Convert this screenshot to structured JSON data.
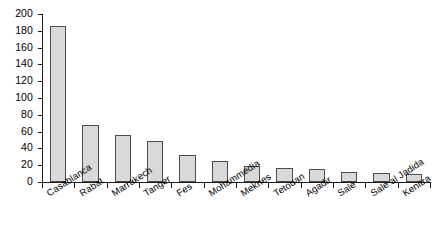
{
  "chart_data": {
    "type": "bar",
    "title": "",
    "xlabel": "",
    "ylabel": "",
    "ylim": [
      0,
      200
    ],
    "ytick_step": 20,
    "grid": false,
    "legend": false,
    "categories": [
      "Casablanca",
      "Rabat",
      "Marrakech",
      "Tanger",
      "Fes",
      "Mohammedia",
      "Meknes",
      "Tetouan",
      "Agadir",
      "Salé",
      "Salé al Jadida",
      "Kenitra"
    ],
    "values": [
      186,
      68,
      56,
      49,
      32,
      25,
      19,
      17,
      15,
      12,
      11,
      9
    ],
    "ytick_labels": [
      "0",
      "20",
      "40",
      "60",
      "80",
      "100",
      "120",
      "140",
      "160",
      "180",
      "200"
    ],
    "bar_fill_color": "#d9d9d9",
    "bar_border_color": "#4d4d4d",
    "axis_color": "#1a1a1a",
    "background_color": "#ffffff"
  }
}
